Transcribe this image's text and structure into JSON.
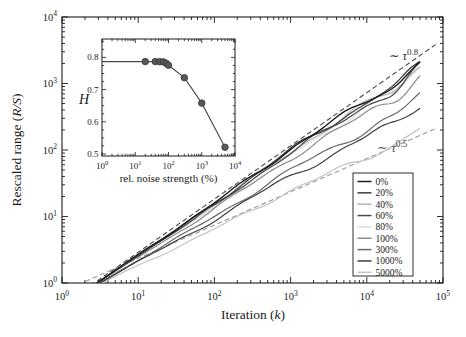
{
  "figure": {
    "bg": "#ffffff",
    "frame_color": "#1a1a1a",
    "text_color": "#1a1a1a"
  },
  "axis_labels": {
    "tick_base": "10",
    "main_x_prefix": "Iteration (",
    "main_x_italic": "k",
    "main_x_suffix": ")",
    "main_y_prefix": "Rescaled range (",
    "main_y_italic": "R/S",
    "main_y_suffix": ")",
    "inset_x": "rel. noise strength (%)",
    "inset_y": "H"
  },
  "annotations": [
    {
      "tilde": "∼",
      "symbol": "τ",
      "exponent": "0.8",
      "x": 389,
      "y": 60,
      "font": 12.5,
      "color": "#2e2e2e"
    },
    {
      "tilde": "∼",
      "symbol": "τ",
      "exponent": "0.5",
      "x": 377,
      "y": 152,
      "font": 13,
      "color": "#4f4f4f"
    }
  ],
  "chart_data": [
    {
      "id": "main",
      "type": "line",
      "xlabel": "Iteration (k)",
      "ylabel": "Rescaled range (R/S)",
      "xscale": "log",
      "yscale": "log",
      "xlim": [
        1,
        100000
      ],
      "ylim": [
        1,
        10000
      ],
      "x_tick_exponents": [
        0,
        1,
        2,
        3,
        4,
        5
      ],
      "y_tick_exponents": [
        0,
        1,
        2,
        3,
        4
      ],
      "grid": false,
      "model": "R/S = A * (k/2)^H for k = 2 ... 50000 (slopes estimated from plot)",
      "amplitude_A": 0.75,
      "k_start": 2,
      "k_end": 50000,
      "series": [
        {
          "name": "0%",
          "H": 0.786,
          "end_value": 2100,
          "color": "#1c1c1c",
          "z": 9,
          "width": 1.4
        },
        {
          "name": "20%",
          "H": 0.779,
          "end_value": 1900,
          "color": "#3c3c3c",
          "z": 8,
          "width": 1.2
        },
        {
          "name": "40%",
          "H": 0.772,
          "end_value": 1750,
          "color": "#b4b4b4",
          "z": 3,
          "width": 1.2
        },
        {
          "name": "60%",
          "H": 0.765,
          "end_value": 1600,
          "color": "#484848",
          "z": 6,
          "width": 1.2
        },
        {
          "name": "80%",
          "H": 0.758,
          "end_value": 1480,
          "color": "#dcdcdc",
          "z": 1,
          "width": 1.2
        },
        {
          "name": "100%",
          "H": 0.734,
          "end_value": 1270,
          "color": "#8a8a8a",
          "z": 4,
          "width": 1.2
        },
        {
          "name": "300%",
          "H": 0.667,
          "end_value": 640,
          "color": "#6a6a6a",
          "z": 5,
          "width": 1.2
        },
        {
          "name": "1000%",
          "H": 0.636,
          "end_value": 470,
          "color": "#3f3f3f",
          "z": 7,
          "width": 1.2
        },
        {
          "name": "5000%",
          "H": 0.554,
          "end_value": 205,
          "color": "#c4c4c4",
          "z": 2,
          "width": 1.2
        }
      ],
      "guides": [
        {
          "label": "∼ τ^0.8",
          "H": 0.8,
          "A": 0.8,
          "k_start": 1.6,
          "k_end": 80000,
          "color": "#4a4a4a",
          "dash": "5,3"
        },
        {
          "label": "∼ τ^0.5",
          "H": 0.5,
          "A": 1.05,
          "k_start": 1.3,
          "k_end": 80000,
          "color": "#9a9a9a",
          "dash": "5,3"
        }
      ],
      "legend_position": "lower right"
    },
    {
      "id": "inset",
      "type": "scatter",
      "xlabel": "rel. noise strength (%)",
      "ylabel": "H",
      "xscale": "log",
      "xlim": [
        1,
        10000
      ],
      "ylim": [
        0.493,
        0.857
      ],
      "x_tick_exponents": [
        0,
        1,
        2,
        3,
        4
      ],
      "y_ticks": [
        "0.5",
        "0.6",
        "0.7",
        "0.8"
      ],
      "baseline": {
        "x": 1,
        "H": 0.787
      },
      "points": [
        {
          "noise": 20,
          "H": 0.787
        },
        {
          "noise": 40,
          "H": 0.787
        },
        {
          "noise": 55,
          "H": 0.7865
        },
        {
          "noise": 70,
          "H": 0.786
        },
        {
          "noise": 85,
          "H": 0.782
        },
        {
          "noise": 100,
          "H": 0.7755
        },
        {
          "noise": 300,
          "H": 0.737
        },
        {
          "noise": 1000,
          "H": 0.658
        },
        {
          "noise": 5000,
          "H": 0.521
        }
      ],
      "point_color": "#575757",
      "point_edge_color": "#333333",
      "line_color": "#4a4a4a"
    }
  ]
}
